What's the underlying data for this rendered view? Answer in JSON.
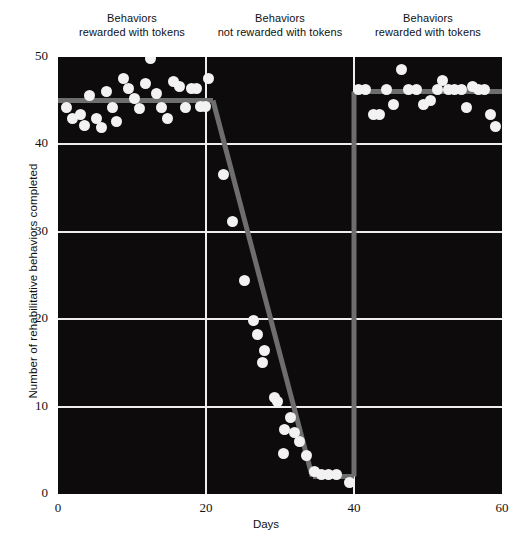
{
  "chart_data": {
    "type": "scatter",
    "title": "",
    "xlabel": "Days",
    "ylabel": "Number of rehabilitative behaviors completed",
    "xlim": [
      0,
      60
    ],
    "ylim": [
      0,
      50
    ],
    "xticks": [
      0,
      20,
      40,
      60
    ],
    "yticks": [
      0,
      10,
      20,
      30,
      40,
      50
    ],
    "grid": true,
    "legend_position": "none",
    "phase_annotations": [
      {
        "line1": "Behaviors",
        "line2": "rewarded with tokens",
        "x_start": 0,
        "x_end": 20
      },
      {
        "line1": "Behaviors",
        "line2": "not rewarded with tokens",
        "x_start": 20,
        "x_end": 40
      },
      {
        "line1": "Behaviors",
        "line2": "rewarded with tokens",
        "x_start": 40,
        "x_end": 60
      }
    ],
    "phase_dividers": [
      20,
      40
    ],
    "series": [
      {
        "name": "Rehabilitative behaviors completed",
        "marker": "circle",
        "marker_color": "#f2f2f2",
        "points": [
          [
            1.2,
            44.2
          ],
          [
            2.0,
            43.0
          ],
          [
            3.0,
            43.4
          ],
          [
            3.6,
            42.2
          ],
          [
            4.3,
            45.6
          ],
          [
            5.2,
            43.0
          ],
          [
            5.9,
            41.9
          ],
          [
            6.6,
            46.0
          ],
          [
            7.4,
            44.2
          ],
          [
            7.9,
            42.6
          ],
          [
            8.8,
            47.5
          ],
          [
            9.5,
            46.4
          ],
          [
            10.3,
            45.3
          ],
          [
            11.0,
            44.1
          ],
          [
            11.8,
            47.0
          ],
          [
            12.5,
            49.8
          ],
          [
            13.3,
            45.8
          ],
          [
            14.0,
            44.2
          ],
          [
            14.8,
            43.0
          ],
          [
            15.6,
            47.2
          ],
          [
            16.4,
            46.6
          ],
          [
            17.2,
            44.2
          ],
          [
            18.0,
            46.4
          ],
          [
            18.7,
            46.4
          ],
          [
            19.2,
            44.3
          ],
          [
            19.9,
            44.3
          ],
          [
            20.4,
            47.5
          ],
          [
            22.4,
            36.6
          ],
          [
            23.6,
            31.2
          ],
          [
            25.2,
            24.4
          ],
          [
            26.4,
            19.9
          ],
          [
            26.9,
            18.2
          ],
          [
            27.6,
            15.0
          ],
          [
            27.9,
            16.4
          ],
          [
            29.3,
            11.0
          ],
          [
            29.7,
            10.6
          ],
          [
            30.6,
            7.4
          ],
          [
            31.4,
            8.8
          ],
          [
            31.9,
            7.0
          ],
          [
            32.6,
            6.0
          ],
          [
            30.5,
            4.6
          ],
          [
            33.6,
            4.4
          ],
          [
            34.6,
            2.6
          ],
          [
            35.6,
            2.2
          ],
          [
            36.6,
            2.2
          ],
          [
            37.6,
            2.2
          ],
          [
            39.4,
            1.3
          ],
          [
            40.6,
            46.3
          ],
          [
            41.6,
            46.3
          ],
          [
            42.6,
            43.4
          ],
          [
            43.4,
            43.4
          ],
          [
            44.4,
            46.3
          ],
          [
            45.3,
            44.6
          ],
          [
            46.4,
            48.6
          ],
          [
            47.4,
            46.3
          ],
          [
            48.4,
            46.3
          ],
          [
            49.4,
            44.6
          ],
          [
            50.3,
            45.0
          ],
          [
            51.3,
            46.3
          ],
          [
            52.0,
            47.3
          ],
          [
            52.8,
            46.3
          ],
          [
            53.6,
            46.3
          ],
          [
            54.5,
            46.3
          ],
          [
            55.2,
            44.2
          ],
          [
            56.0,
            46.6
          ],
          [
            56.8,
            46.3
          ],
          [
            57.6,
            46.3
          ],
          [
            58.4,
            43.4
          ],
          [
            59.1,
            42.0
          ]
        ]
      }
    ],
    "trend_line": {
      "color": "#6e6e6e",
      "width_px": 5,
      "segments": [
        {
          "x1": 0.0,
          "y1": 45.0,
          "x2": 21.0,
          "y2": 45.0
        },
        {
          "x1": 21.0,
          "y1": 45.0,
          "x2": 34.4,
          "y2": 2.0
        },
        {
          "x1": 34.4,
          "y1": 2.0,
          "x2": 40.0,
          "y2": 2.0
        },
        {
          "x1": 40.0,
          "y1": 2.0,
          "x2": 40.0,
          "y2": 46.0
        },
        {
          "x1": 40.0,
          "y1": 46.0,
          "x2": 60.0,
          "y2": 46.0
        }
      ]
    }
  },
  "axis": {
    "x_tick_labels": [
      "0",
      "20",
      "40",
      "60"
    ],
    "y_tick_labels": [
      "0",
      "10",
      "20",
      "30",
      "40",
      "50"
    ],
    "x_title": "Days",
    "y_title": "Number of rehabilitative behaviors completed"
  },
  "colors": {
    "plot_background": "#0d0b0b",
    "gridline": "#efefef",
    "marker": "#f2f2f2",
    "trend": "#6e6e6e",
    "page_background": "#ffffff",
    "text": "#111111"
  }
}
